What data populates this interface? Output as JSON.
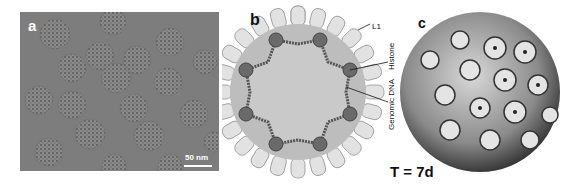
{
  "figure": {
    "panels": [
      {
        "id": "a",
        "label": "a",
        "type": "cryo-EM micrograph",
        "scale_bar": "50 nm"
      },
      {
        "id": "b",
        "label": "b",
        "type": "schematic diagram",
        "annotations": [
          "L1",
          "Histone",
          "Genomic DNA"
        ]
      },
      {
        "id": "c",
        "label": "c",
        "type": "3D capsid reconstruction",
        "caption": "T = 7d"
      }
    ],
    "colors": {
      "micrograph_bg": "#7d7d7d",
      "capsomere_fill": "#e2e2e2",
      "capsid_shell": "#bdbdbd",
      "interior": "#c6c6c6",
      "dna": "#555555"
    }
  }
}
